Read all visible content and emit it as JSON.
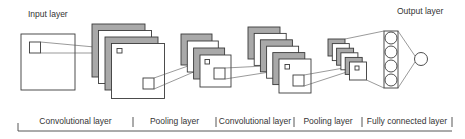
{
  "labels": {
    "input": "Input layer",
    "output": "Output layer"
  },
  "sections": [
    {
      "label": "Convolutional layer",
      "x0": 18,
      "x1": 133
    },
    {
      "label": "Pooling layer",
      "x0": 133,
      "x1": 216
    },
    {
      "label": "Convolutional layer",
      "x0": 216,
      "x1": 294
    },
    {
      "label": "Pooling layer",
      "x0": 294,
      "x1": 362
    },
    {
      "label": "Fully connected layer",
      "x0": 362,
      "x1": 452
    }
  ],
  "colors": {
    "stroke": "#3a3a3a",
    "gray_fill": "#a9a9a9",
    "white_fill": "#ffffff",
    "text": "#333333"
  },
  "stacks": [
    {
      "name": "conv1",
      "count": 4,
      "x": 92,
      "y": 24,
      "size": 53,
      "dx": 6.5,
      "dy": 6.5
    },
    {
      "name": "pool1",
      "count": 4,
      "x": 181,
      "y": 34,
      "size": 31,
      "dx": 6.3,
      "dy": 7
    },
    {
      "name": "conv2",
      "count": 6,
      "x": 248,
      "y": 27,
      "size": 32,
      "dx": 6.2,
      "dy": 6.4
    },
    {
      "name": "pool2",
      "count": 6,
      "x": 328,
      "y": 39,
      "size": 17,
      "dx": 4.3,
      "dy": 4.6
    }
  ],
  "fully_connected": {
    "neurons": 4
  },
  "output": {
    "neurons": 1
  }
}
